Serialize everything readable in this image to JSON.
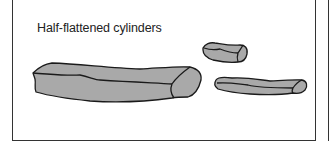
{
  "figure": {
    "label": "Half-flattened cylinders",
    "shape_fill": "#a9a9a9",
    "outline_color": "#1a1a1a",
    "shapes": [
      {
        "name": "large-cylinder"
      },
      {
        "name": "small-cylinder"
      },
      {
        "name": "medium-cylinder"
      }
    ]
  }
}
